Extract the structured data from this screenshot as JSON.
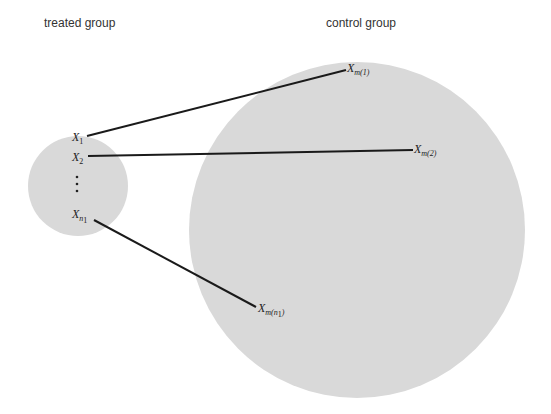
{
  "titles": {
    "treated": "treated group",
    "control": "control group"
  },
  "colors": {
    "background": "#ffffff",
    "circle_fill": "#d9d9d9",
    "line": "#1a1a1a",
    "text": "#333333"
  },
  "treated_circle": {
    "cx": 78,
    "cy": 186,
    "r": 50
  },
  "control_circle": {
    "cx": 357,
    "cy": 230,
    "r": 168
  },
  "treated_units": [
    {
      "base": "X",
      "sub": "1",
      "sub_italic": false,
      "x": 72,
      "y": 141
    },
    {
      "base": "X",
      "sub": "2",
      "sub_italic": false,
      "x": 72,
      "y": 161
    },
    {
      "base": "X",
      "sub": "n",
      "sub2": "1",
      "sub_italic": true,
      "x": 72,
      "y": 218
    }
  ],
  "ellipsis": "⋮",
  "control_matches": [
    {
      "base": "X",
      "sub": "m(1)",
      "x": 347,
      "y": 72
    },
    {
      "base": "X",
      "sub": "m(2)",
      "x": 414,
      "y": 153
    },
    {
      "base": "X",
      "sub": "m(n",
      "sub2": "1",
      "sub_close": ")",
      "x": 258,
      "y": 312
    }
  ],
  "match_lines": [
    {
      "from": "X_1",
      "to": "X_m(1)",
      "x1": 87,
      "y1": 136,
      "x2": 346,
      "y2": 70
    },
    {
      "from": "X_2",
      "to": "X_m(2)",
      "x1": 88,
      "y1": 156,
      "x2": 413,
      "y2": 150
    },
    {
      "from": "X_n1",
      "to": "X_m(n1)",
      "x1": 94,
      "y1": 220,
      "x2": 256,
      "y2": 307
    }
  ]
}
